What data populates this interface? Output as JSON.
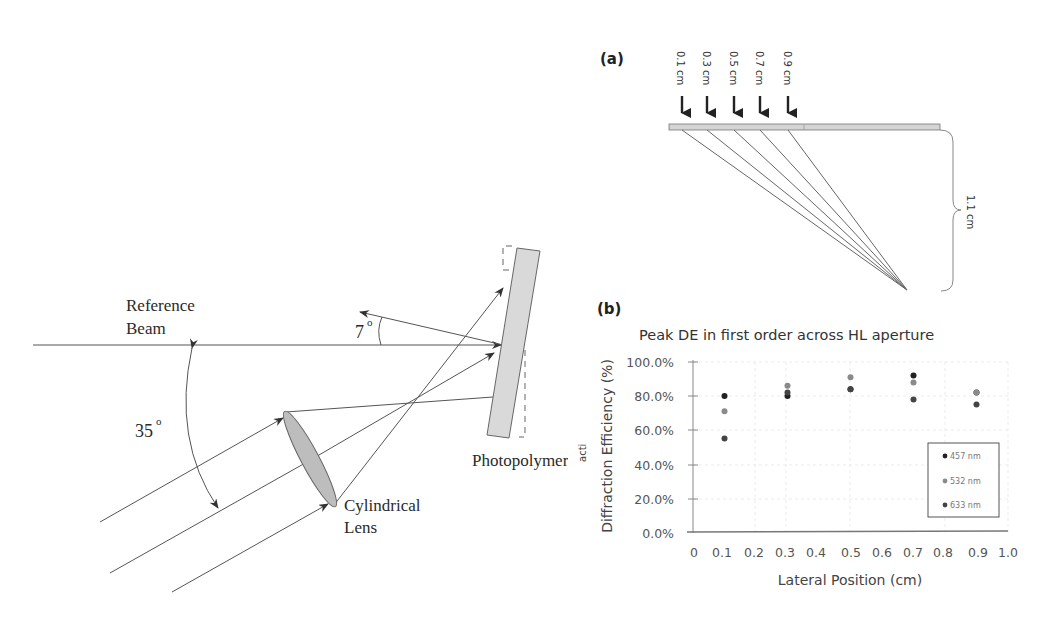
{
  "figure_left": {
    "labels": {
      "reference_beam_line1": "Reference",
      "reference_beam_line2": "Beam",
      "angle_diffracted": "7",
      "angle_incident": "35",
      "degree_symbol": "o",
      "photopolymer": "Photopolymer",
      "lens_line1": "Cylindrical",
      "lens_line2": "Lens"
    },
    "colors": {
      "plate_fill": "#d6d6d6",
      "lens_fill": "#bdbdbd",
      "line": "#555555"
    }
  },
  "figure_a": {
    "panel_label": "(a)",
    "positions": [
      "0.1 cm",
      "0.3 cm",
      "0.5 cm",
      "0.7 cm",
      "0.9 cm"
    ],
    "height_label": "1.1 cm"
  },
  "figure_b": {
    "panel_label": "(b)",
    "fragment": "acti"
  },
  "chart_data": {
    "type": "scatter",
    "title": "Peak DE in first order across HL aperture",
    "xlabel": "Lateral Position (cm)",
    "ylabel": "Diffraction Efficiency (%)",
    "xlim": [
      0,
      1.0
    ],
    "ylim": [
      0,
      100
    ],
    "x_ticks": [
      "0",
      "0.1",
      "0.2",
      "0.3",
      "0.4",
      "0.5",
      "0.6",
      "0.7",
      "0.8",
      "0.9",
      "1.0"
    ],
    "y_ticks": [
      "0.0%",
      "20.0%",
      "40.0%",
      "60.0%",
      "80.0%",
      "100.0%"
    ],
    "grid": true,
    "legend_position": "lower right",
    "series": [
      {
        "name": "457 nm",
        "color": "#222222",
        "x": [
          0.1,
          0.3,
          0.5,
          0.7,
          0.9
        ],
        "y": [
          80,
          80,
          84,
          92,
          82
        ]
      },
      {
        "name": "532 nm",
        "color": "#8a8a8a",
        "x": [
          0.1,
          0.3,
          0.5,
          0.7,
          0.9
        ],
        "y": [
          71,
          86,
          91,
          88,
          82
        ]
      },
      {
        "name": "633 nm",
        "color": "#444444",
        "x": [
          0.1,
          0.3,
          0.5,
          0.7,
          0.9
        ],
        "y": [
          55,
          82,
          84,
          78,
          75
        ]
      }
    ]
  }
}
